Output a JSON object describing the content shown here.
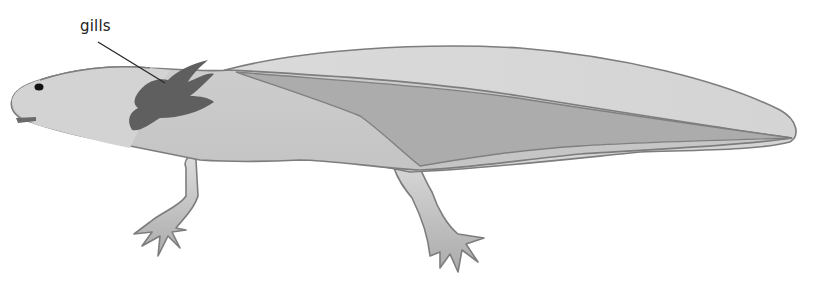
{
  "diagram": {
    "labels": [
      {
        "text": "gills",
        "target": "gills"
      }
    ]
  },
  "colors": {
    "background": "#ffffff",
    "outline": "#7d7d7d",
    "body_light": "#d6d6d6",
    "body_mid": "#c2c2c2",
    "fin_stripe": "#a9a9a9",
    "gills": "#5f5f5f",
    "eye": "#111111",
    "leader_line": "#2a2a2a",
    "label_text": "#222222"
  }
}
